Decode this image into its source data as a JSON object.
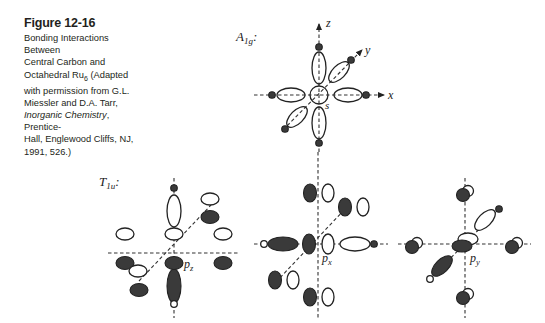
{
  "caption": {
    "title": "Figure 12-16",
    "line1": "Bonding Interactions Between",
    "line2": "Central Carbon and",
    "line3_pre": "Octahedral Ru",
    "line3_sub": "6",
    "line3_post": " (Adapted",
    "line4": "with permission from G.L.",
    "line5": "Miessler and D.A. Tarr,",
    "line6_italic": "Inorganic Chemistry",
    "line6_post": ", Prentice-",
    "line7": "Hall, Englewood Cliffs, NJ,",
    "line8": "1991, 526.)"
  },
  "diagram_a1g": {
    "symmetry_main": "A",
    "symmetry_sub": "1g",
    "colon": ":",
    "axis_x": "x",
    "axis_y": "y",
    "axis_z": "z",
    "orbital_label": "s"
  },
  "diagram_t1u": {
    "symmetry_main": "T",
    "symmetry_sub": "1u",
    "colon": ":",
    "panels": [
      {
        "orbital_main": "p",
        "orbital_sub": "z"
      },
      {
        "orbital_main": "p",
        "orbital_sub": "x"
      },
      {
        "orbital_main": "p",
        "orbital_sub": "y"
      }
    ]
  },
  "colors": {
    "ink": "#222222",
    "shaded_lobe": "#3a3a3a",
    "background": "#ffffff"
  }
}
